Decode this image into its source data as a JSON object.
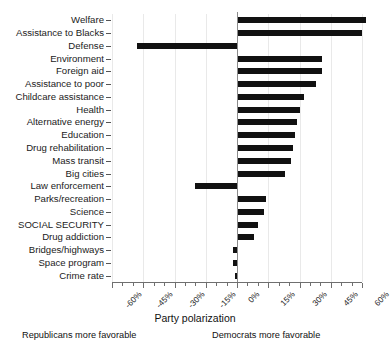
{
  "chart_data": {
    "type": "bar",
    "orientation": "horizontal",
    "title": "",
    "xlabel": "Party polarization",
    "ylabel": "",
    "xlim": [
      -60,
      60
    ],
    "xticks": [
      -60,
      -45,
      -30,
      -15,
      0,
      15,
      30,
      45,
      60
    ],
    "xticklabels": [
      "-60%",
      "-45%",
      "-30%",
      "-15%",
      "0%",
      "15%",
      "30%",
      "45%",
      "60%"
    ],
    "minor_tick_step": 5,
    "grid": true,
    "legend": false,
    "units": "percent",
    "annotations": [
      {
        "text": "Republicans more favorable",
        "side": "left"
      },
      {
        "text": "Democrats more favorable",
        "side": "right"
      }
    ],
    "categories": [
      "Welfare",
      "Assistance to Blacks",
      "Defense",
      "Environment",
      "Foreign aid",
      "Assistance to poor",
      "Childcare assistance",
      "Health",
      "Alternative energy",
      "Education",
      "Drug rehabilitation",
      "Mass transit",
      "Big cities",
      "Law enforcement",
      "Parks/recreation",
      "Science",
      "SOCIAL SECURITY",
      "Drug addiction",
      "Bridges/highways",
      "Space program",
      "Crime rate"
    ],
    "values": [
      62,
      60,
      -48,
      41,
      41,
      38,
      32,
      30,
      29,
      28,
      27,
      26,
      23,
      -20,
      14,
      13,
      10,
      8,
      -2,
      -2,
      -1
    ]
  },
  "axis": {
    "title": "Party polarization",
    "note_left": "Republicans more favorable",
    "note_right": "Democrats more favorable"
  }
}
